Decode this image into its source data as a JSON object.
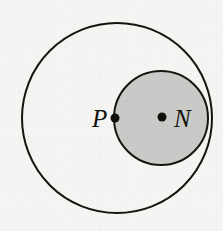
{
  "figure": {
    "type": "geometry-diagram",
    "background_color": "#f4f4f2",
    "stroke_color": "#15150f",
    "shaded_fill_color": "#c9c9c7",
    "point_color": "#101008",
    "canvas": {
      "width": 223,
      "height": 231
    },
    "shapes": [
      {
        "name": "large-circle",
        "kind": "circle",
        "center_x": 117,
        "center_y": 118,
        "radius": 95,
        "filled": false,
        "fill": "none",
        "stroke_width": 2
      },
      {
        "name": "small-circle",
        "kind": "circle",
        "center_x": 161,
        "center_y": 118,
        "radius": 47,
        "filled": true,
        "fill": "#c9c9c7",
        "stroke_width": 2
      }
    ],
    "points": [
      {
        "name": "point-p",
        "label": "P",
        "center_x": 115,
        "center_y": 118,
        "marker_radius": 4.5,
        "label_x": 92,
        "label_y": 127,
        "label_anchor": "start"
      },
      {
        "name": "point-n",
        "label": "N",
        "center_x": 162,
        "center_y": 117,
        "marker_radius": 4.5,
        "label_x": 174,
        "label_y": 127,
        "label_anchor": "start"
      }
    ]
  }
}
